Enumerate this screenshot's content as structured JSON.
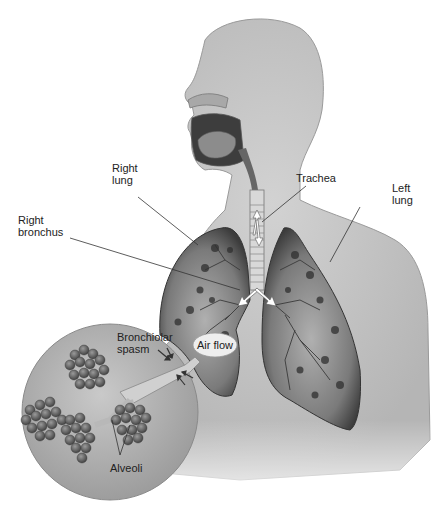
{
  "figure": {
    "colors": {
      "background": "#ffffff",
      "body_fill": "#c4c4c4",
      "lung_fill": "#8a8a8a",
      "lung_dark": "#3a3a3a",
      "label_text": "#222222",
      "leader_line": "#333333",
      "arrow_fill": "#ffffff"
    }
  },
  "labels": {
    "trachea": "Trachea",
    "right_lung": "Right\nlung",
    "left_lung": "Left\nlung",
    "right_bronchus": "Right\nbronchus",
    "bronchiolar_spasm": "Bronchiolar\nspasm",
    "air_flow": "Air flow",
    "alveoli": "Alveoli"
  },
  "inset": {
    "description": "Magnified circular view of bronchiole with alveoli clusters",
    "shape": "circle"
  }
}
